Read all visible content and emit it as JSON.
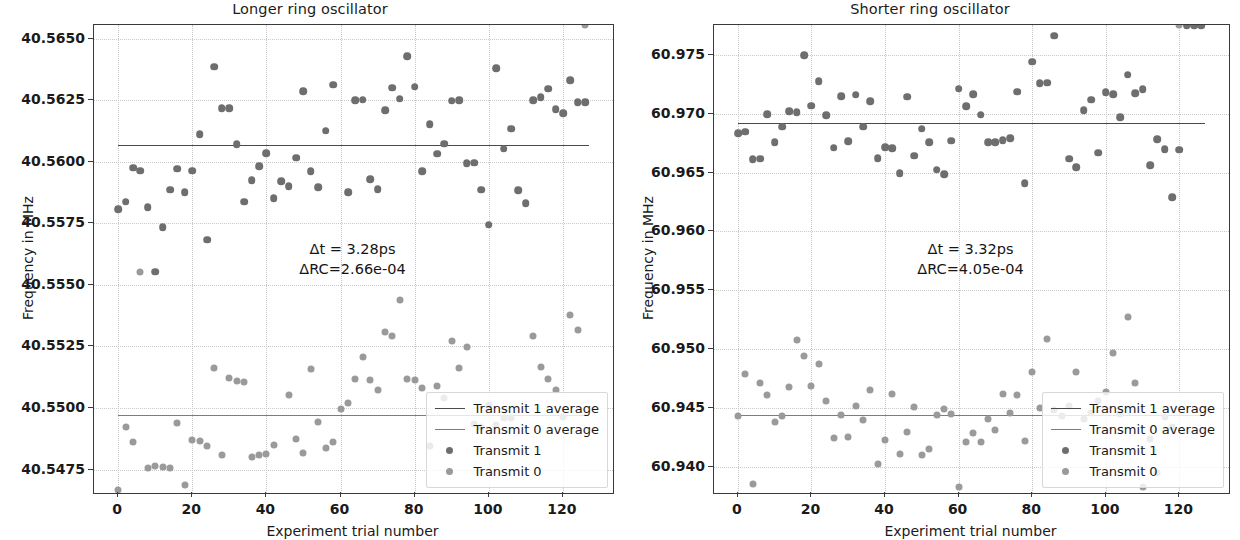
{
  "figure": {
    "width": 1240,
    "height": 540,
    "background": "#ffffff",
    "marker_color_transmit1": "#6e6e6e",
    "marker_color_transmit0": "#9a9a9a",
    "line_color_transmit1": "#4a4a4a",
    "line_color_transmit0": "#7c7c7c",
    "grid_color": "#c9c9c9",
    "axis_color": "#3a3a3a"
  },
  "legend": {
    "position": "lower right",
    "entries": [
      {
        "label": "Transmit 1 average",
        "kind": "line",
        "series": "t1"
      },
      {
        "label": "Transmit 0 average",
        "kind": "line",
        "series": "t0"
      },
      {
        "label": "Transmit 1",
        "kind": "marker",
        "series": "t1"
      },
      {
        "label": "Transmit 0",
        "kind": "marker",
        "series": "t0"
      }
    ]
  },
  "chart_data": [
    {
      "panel": "left",
      "type": "scatter",
      "title": "Longer ring oscillator",
      "xlabel": "Experiment trial number",
      "ylabel": "Frequency in MHz",
      "grid": true,
      "xlim": [
        -6.5,
        133.5
      ],
      "ylim": [
        40.54655,
        40.56555
      ],
      "xticks": [
        0,
        20,
        40,
        60,
        80,
        100,
        120
      ],
      "xtick_labels": [
        "0",
        "20",
        "40",
        "60",
        "80",
        "100",
        "120"
      ],
      "yticks": [
        40.5475,
        40.55,
        40.5525,
        40.555,
        40.5575,
        40.56,
        40.5625,
        40.565
      ],
      "ytick_labels": [
        "40.5475",
        "40.5500",
        "40.5525",
        "40.5550",
        "40.5575",
        "40.5600",
        "40.5625",
        "40.5650"
      ],
      "annotation": "Δt = 3.28ps\nΔRC=2.66e-04",
      "annotation_lines": [
        "Δt = 3.28ps",
        "ΔRC=2.66e-04"
      ],
      "delta_t": "3.28ps",
      "delta_rc": "2.66e-04",
      "averages": {
        "transmit1": 40.56068,
        "transmit0": 40.54972
      },
      "series": [
        {
          "name": "Transmit 1",
          "x": [
            0,
            1,
            2,
            3,
            4,
            5,
            6,
            7,
            8,
            9,
            10,
            11,
            12,
            13,
            14,
            15,
            16,
            17,
            18,
            19,
            20,
            21,
            22,
            23,
            24,
            25,
            26,
            27,
            28,
            29,
            30,
            31,
            32,
            33,
            34,
            35,
            36,
            37,
            38,
            39,
            40,
            41,
            42,
            43,
            44,
            45,
            46,
            47,
            48,
            49,
            50,
            51,
            52,
            53,
            54,
            55,
            56,
            57,
            58,
            59,
            60,
            61,
            62,
            63
          ],
          "y": [
            40.55807,
            40.55838,
            40.55975,
            40.55963,
            40.55815,
            40.55554,
            40.55735,
            40.55887,
            40.55972,
            40.55876,
            40.55963,
            40.56112,
            40.55684,
            40.56385,
            40.56218,
            40.56217,
            40.56072,
            40.55838,
            40.55925,
            40.55981,
            40.56035,
            40.55853,
            40.55921,
            40.55901,
            40.56016,
            40.56286,
            40.55961,
            40.55897,
            40.56126,
            40.56312,
            40.56654,
            40.55876,
            40.56249,
            40.56252,
            40.55928,
            40.55889,
            40.56209,
            40.56301,
            40.56256,
            40.56429,
            40.56305,
            40.55961,
            40.56152,
            40.56032,
            40.56073,
            40.56247,
            40.56249,
            40.55994,
            40.55996,
            40.55886,
            40.55745,
            40.56379,
            40.56052,
            40.56134,
            40.55884,
            40.55832,
            40.56249,
            40.56263,
            40.56297,
            40.56214,
            40.56198,
            40.56331,
            40.56241,
            40.56241
          ]
        },
        {
          "name": "Transmit 0",
          "x": [
            0,
            1,
            2,
            3,
            4,
            5,
            6,
            7,
            8,
            9,
            10,
            11,
            12,
            13,
            14,
            15,
            16,
            17,
            18,
            19,
            20,
            21,
            22,
            23,
            24,
            25,
            26,
            27,
            28,
            29,
            30,
            31,
            32,
            33,
            34,
            35,
            36,
            37,
            38,
            39,
            40,
            41,
            42,
            43,
            44,
            45,
            46,
            47,
            48,
            49,
            50,
            51,
            52,
            53,
            54,
            55,
            56,
            57,
            58,
            59,
            60,
            61,
            62,
            63
          ],
          "y": [
            40.54668,
            40.54922,
            40.54861,
            40.55552,
            40.54758,
            40.54763,
            40.54761,
            40.54756,
            40.54941,
            40.54688,
            40.54872,
            40.54866,
            40.54847,
            40.55164,
            40.54811,
            40.55121,
            40.55108,
            40.55107,
            40.54801,
            40.54809,
            40.54812,
            40.54848,
            40.54606,
            40.55053,
            40.54873,
            40.54816,
            40.5516,
            40.54943,
            40.54837,
            40.54862,
            40.54995,
            40.55021,
            40.55116,
            40.55209,
            40.55112,
            40.55073,
            40.55307,
            40.55292,
            40.55437,
            40.55117,
            40.55113,
            40.55081,
            40.54847,
            40.55091,
            40.55042,
            40.55273,
            40.55164,
            40.55249,
            40.54935,
            40.54922,
            40.55012,
            40.54932,
            40.54959,
            40.54959,
            40.54598,
            40.54555,
            40.55291,
            40.55165,
            40.55119,
            40.55073,
            40.54964,
            40.55379,
            40.55316
          ]
        }
      ]
    },
    {
      "panel": "right",
      "type": "scatter",
      "title": "Shorter ring oscillator",
      "xlabel": "Experiment trial number",
      "ylabel": "Frequency in MHz",
      "grid": true,
      "xlim": [
        -6.5,
        133.5
      ],
      "ylim": [
        60.93775,
        60.97755
      ],
      "xticks": [
        0,
        20,
        40,
        60,
        80,
        100,
        120
      ],
      "xtick_labels": [
        "0",
        "20",
        "40",
        "60",
        "80",
        "100",
        "120"
      ],
      "yticks": [
        60.94,
        60.945,
        60.95,
        60.955,
        60.96,
        60.965,
        60.97,
        60.975
      ],
      "ytick_labels": [
        "60.940",
        "60.945",
        "60.950",
        "60.955",
        "60.960",
        "60.965",
        "60.970",
        "60.975"
      ],
      "annotation": "Δt = 3.32ps\nΔRC=4.05e-04",
      "annotation_lines": [
        "Δt = 3.32ps",
        "ΔRC=4.05e-04"
      ],
      "delta_t": "3.32ps",
      "delta_rc": "4.05e-04",
      "averages": {
        "transmit1": 60.96918,
        "transmit0": 60.94435
      },
      "series": [
        {
          "name": "Transmit 1",
          "x": [
            0,
            1,
            2,
            3,
            4,
            5,
            6,
            7,
            8,
            9,
            10,
            11,
            12,
            13,
            14,
            15,
            16,
            17,
            18,
            19,
            20,
            21,
            22,
            23,
            24,
            25,
            26,
            27,
            28,
            29,
            30,
            31,
            32,
            33,
            34,
            35,
            36,
            37,
            38,
            39,
            40,
            41,
            42,
            43,
            44,
            45,
            46,
            47,
            48,
            49,
            50,
            51,
            52,
            53,
            54,
            55,
            56,
            57,
            58,
            59,
            60,
            61,
            62,
            63
          ],
          "y": [
            60.96835,
            60.96847,
            60.96616,
            60.96617,
            60.96997,
            60.96759,
            60.96889,
            60.97021,
            60.97015,
            60.97497,
            60.97069,
            60.97275,
            60.96988,
            60.96713,
            60.97148,
            60.96767,
            60.97163,
            60.96891,
            60.97106,
            60.96623,
            60.96715,
            60.96705,
            60.96497,
            60.97144,
            60.96642,
            60.96872,
            60.96756,
            60.96524,
            60.96487,
            60.96771,
            60.97214,
            60.97064,
            60.97167,
            60.96993,
            60.96759,
            60.96757,
            60.96774,
            60.9679,
            60.97188,
            60.96411,
            60.97443,
            60.97262,
            60.97263,
            60.97665,
            60.97822,
            60.96619,
            60.96544,
            60.9703,
            60.97121,
            60.9667,
            60.97186,
            60.97166,
            60.96972,
            60.97334,
            60.97176,
            60.97211,
            60.96564,
            60.96786,
            60.96697,
            60.96289,
            60.96693
          ]
        },
        {
          "name": "Transmit 0",
          "x": [
            0,
            1,
            2,
            3,
            4,
            5,
            6,
            7,
            8,
            9,
            10,
            11,
            12,
            13,
            14,
            15,
            16,
            17,
            18,
            19,
            20,
            21,
            22,
            23,
            24,
            25,
            26,
            27,
            28,
            29,
            30,
            31,
            32,
            33,
            34,
            35,
            36,
            37,
            38,
            39,
            40,
            41,
            42,
            43,
            44,
            45,
            46,
            47,
            48,
            49,
            50,
            51,
            52,
            53,
            54,
            55,
            56,
            57,
            58,
            59,
            60,
            61,
            62,
            63
          ],
          "y": [
            60.94431,
            60.94787,
            60.93854,
            60.94707,
            60.94612,
            60.94383,
            60.94427,
            60.94679,
            60.95072,
            60.94941,
            60.94684,
            60.94873,
            60.94561,
            60.94239,
            60.94435,
            60.94248,
            60.94515,
            60.94392,
            60.94648,
            60.94019,
            60.94224,
            60.94613,
            60.94108,
            60.94292,
            60.9451,
            60.94101,
            60.94153,
            60.94435,
            60.94492,
            60.94447,
            60.93824,
            60.94209,
            60.94283,
            60.94205,
            60.94407,
            60.94309,
            60.94617,
            60.94456,
            60.9461,
            60.94214,
            60.94803,
            60.94502,
            60.95086,
            60.94482,
            60.94431,
            60.94519,
            60.94801,
            60.94403,
            60.94455,
            60.94556,
            60.94632,
            60.94969,
            60.94446,
            60.95272,
            60.94713,
            60.9383,
            60.94231,
            60.93946,
            60.94418,
            60.94339
          ]
        }
      ]
    }
  ]
}
